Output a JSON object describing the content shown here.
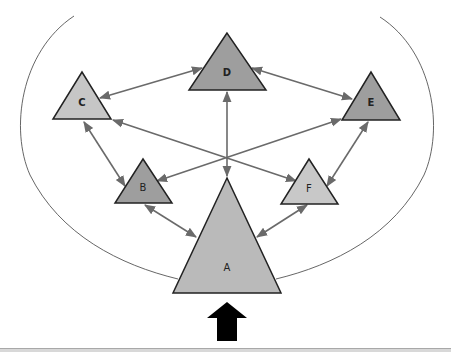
{
  "diagram": {
    "title": "",
    "colors": {
      "background": "#ffffff",
      "connector": "#6a6a6a",
      "outline": "#222222",
      "enclosure": "#555555",
      "input_arrow": "#000000",
      "dark_node": "#9e9e9e",
      "light_node": "#c8c8c8",
      "base_node": "#bababa"
    },
    "nodes": [
      {
        "id": "A",
        "label": "A",
        "shade": "base"
      },
      {
        "id": "B",
        "label": "B",
        "shade": "dark"
      },
      {
        "id": "C",
        "label": "C",
        "shade": "light"
      },
      {
        "id": "D",
        "label": "D",
        "shade": "dark"
      },
      {
        "id": "E",
        "label": "E",
        "shade": "dark"
      },
      {
        "id": "F",
        "label": "F",
        "shade": "light"
      }
    ],
    "edges": [
      {
        "from": "C",
        "to": "D",
        "bidirectional": true
      },
      {
        "from": "D",
        "to": "E",
        "bidirectional": true
      },
      {
        "from": "C",
        "to": "B",
        "bidirectional": true
      },
      {
        "from": "E",
        "to": "F",
        "bidirectional": true
      },
      {
        "from": "C",
        "to": "F",
        "bidirectional": true
      },
      {
        "from": "E",
        "to": "B",
        "bidirectional": true
      },
      {
        "from": "D",
        "to": "A",
        "bidirectional": true
      },
      {
        "from": "B",
        "to": "A",
        "bidirectional": true
      },
      {
        "from": "F",
        "to": "A",
        "bidirectional": true
      }
    ],
    "enclosure": "open curved boundary surrounding all nodes, closing at node A",
    "input_arrow": {
      "direction": "up",
      "target": "A"
    }
  }
}
